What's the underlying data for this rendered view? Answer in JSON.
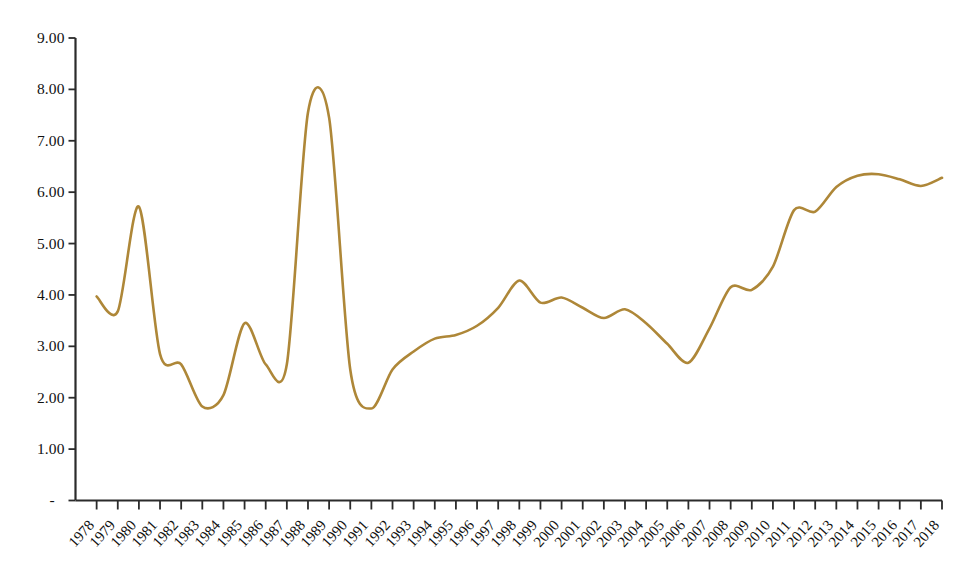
{
  "chart_data": {
    "type": "line",
    "title": "",
    "subtitle": "",
    "xlabel": "",
    "ylabel": "",
    "x": [
      1978,
      1979,
      1980,
      1981,
      1982,
      1983,
      1984,
      1985,
      1986,
      1987,
      1988,
      1989,
      1990,
      1991,
      1992,
      1993,
      1994,
      1995,
      1996,
      1997,
      1998,
      1999,
      2000,
      2001,
      2002,
      2003,
      2004,
      2005,
      2006,
      2007,
      2008,
      2009,
      2010,
      2011,
      2012,
      2013,
      2014,
      2015,
      2016,
      2017,
      2018
    ],
    "categories": [
      "1978",
      "1979",
      "1980",
      "1981",
      "1982",
      "1983",
      "1984",
      "1985",
      "1986",
      "1987",
      "1988",
      "1989",
      "1990",
      "1991",
      "1992",
      "1993",
      "1994",
      "1995",
      "1996",
      "1997",
      "1998",
      "1999",
      "2000",
      "2001",
      "2002",
      "2003",
      "2004",
      "2005",
      "2006",
      "2007",
      "2008",
      "2009",
      "2010",
      "2011",
      "2012",
      "2013",
      "2014",
      "2015",
      "2016",
      "2017",
      "2018"
    ],
    "values": [
      3.97,
      3.68,
      5.72,
      2.85,
      2.65,
      1.83,
      2.05,
      3.45,
      2.65,
      2.65,
      7.55,
      7.45,
      2.55,
      1.79,
      2.55,
      2.9,
      3.15,
      3.22,
      3.4,
      3.75,
      4.28,
      3.85,
      3.95,
      3.75,
      3.55,
      3.72,
      3.45,
      3.05,
      2.68,
      3.35,
      4.15,
      4.1,
      4.55,
      5.65,
      5.62,
      6.1,
      6.32,
      6.35,
      6.25,
      6.12,
      6.28
    ],
    "series": [
      {
        "name": "series-1",
        "color": "#AE8738",
        "values": [
          3.97,
          3.68,
          5.72,
          2.85,
          2.65,
          1.83,
          2.05,
          3.45,
          2.65,
          2.65,
          7.55,
          7.45,
          2.55,
          1.79,
          2.55,
          2.9,
          3.15,
          3.22,
          3.4,
          3.75,
          4.28,
          3.85,
          3.95,
          3.75,
          3.55,
          3.72,
          3.45,
          3.05,
          2.68,
          3.35,
          4.15,
          4.1,
          4.55,
          5.65,
          5.62,
          6.1,
          6.32,
          6.35,
          6.25,
          6.12,
          6.28
        ]
      }
    ],
    "ylim": [
      0,
      9
    ],
    "xlim": [
      1978,
      2018
    ],
    "y_ticks": [
      0,
      1,
      2,
      3,
      4,
      5,
      6,
      7,
      8,
      9
    ],
    "y_tick_labels": [
      "-",
      "1.00",
      "2.00",
      "3.00",
      "4.00",
      "5.00",
      "6.00",
      "7.00",
      "8.00",
      "9.00"
    ],
    "grid": false,
    "legend": false,
    "legend_position": "none",
    "annotations": [],
    "line_color": "#AE8738",
    "axis_color": "#2b2b2b",
    "background": "#ffffff",
    "smoothing": "spline"
  },
  "axes": {
    "y_labels": [
      "9.00",
      "8.00",
      "7.00",
      "6.00",
      "5.00",
      "4.00",
      "3.00",
      "2.00",
      "1.00"
    ],
    "y_zero_mark": "-",
    "x_labels": [
      "1978",
      "1979",
      "1980",
      "1981",
      "1982",
      "1983",
      "1984",
      "1985",
      "1986",
      "1987",
      "1988",
      "1989",
      "1990",
      "1991",
      "1992",
      "1993",
      "1994",
      "1995",
      "1996",
      "1997",
      "1998",
      "1999",
      "2000",
      "2001",
      "2002",
      "2003",
      "2004",
      "2005",
      "2006",
      "2007",
      "2008",
      "2009",
      "2010",
      "2011",
      "2012",
      "2013",
      "2014",
      "2015",
      "2016",
      "2017",
      "2018"
    ]
  }
}
